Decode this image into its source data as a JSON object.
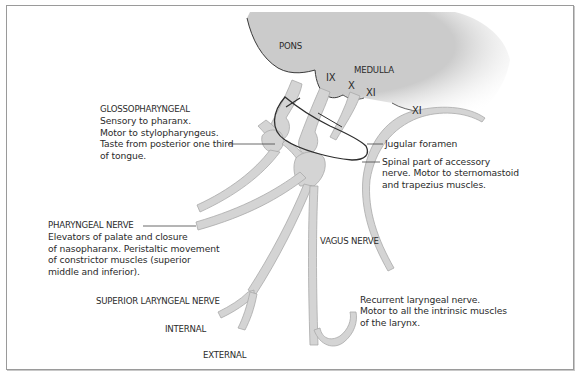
{
  "diagram": {
    "type": "anatomical-illustration",
    "colors": {
      "background": "#ffffff",
      "frame": "#9a9a9a",
      "brainstem_fill": "#cfcfcf",
      "nerve_fill": "#d4d4d4",
      "nerve_edge": "#a9a9a9",
      "outline": "#3a3a3a",
      "leader_line": "#444444",
      "text": "#2b2b2b"
    },
    "structures": {
      "pons": "PONS",
      "medulla": "MEDULLA",
      "nerve_ix": "IX",
      "nerve_x": "X",
      "nerve_xi": "XI",
      "nerve_xi_spinal": "XI"
    },
    "labels": {
      "glossopharyngeal": {
        "title": "GLOSSOPHARYNGEAL",
        "lines": [
          "Sensory to pharanx.",
          "Motor to stylopharyngeus.",
          "Taste from posterior one third",
          "of tongue."
        ]
      },
      "jugular_foramen": "Jugular foramen",
      "spinal_accessory": {
        "lines": [
          "Spinal part of accessory",
          "nerve. Motor to sternomastoid",
          "and trapezius muscles."
        ]
      },
      "pharyngeal_nerve": {
        "title": "PHARYNGEAL NERVE",
        "lines": [
          "Elevators of palate and closure",
          "of nasopharanx. Peristaltic movement",
          "of constrictor muscles (superior",
          "middle and inferior)."
        ]
      },
      "vagus_nerve": "VAGUS NERVE",
      "superior_laryngeal_nerve": "SUPERIOR LARYNGEAL NERVE",
      "internal": "INTERNAL",
      "external": "EXTERNAL",
      "recurrent_laryngeal": {
        "lines": [
          "Recurrent laryngeal nerve.",
          "Motor to all the intrinsic muscles",
          "of the larynx."
        ]
      }
    }
  }
}
